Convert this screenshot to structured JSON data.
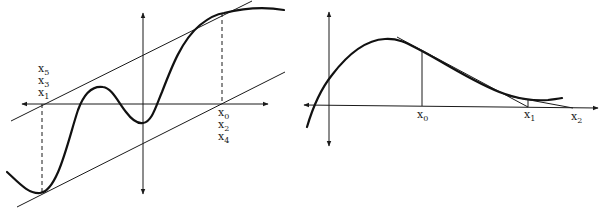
{
  "figures": [
    {
      "id": "left",
      "description": "Newton's method oscillating cycle between two points with parallel tangent lines",
      "labels_left": [
        "x",
        "x",
        "x"
      ],
      "labels_left_sub": [
        "5",
        "3",
        "1"
      ],
      "labels_right": [
        "x",
        "x",
        "x"
      ],
      "labels_right_sub": [
        "0",
        "2",
        "4"
      ]
    },
    {
      "id": "right",
      "description": "Newton's method iterates via successive tangent lines",
      "labels": [
        "x",
        "x",
        "x"
      ],
      "labels_sub": [
        "0",
        "1",
        "2"
      ]
    }
  ],
  "colors": {
    "stroke": "#1a1a1a",
    "curve": "#111111"
  }
}
